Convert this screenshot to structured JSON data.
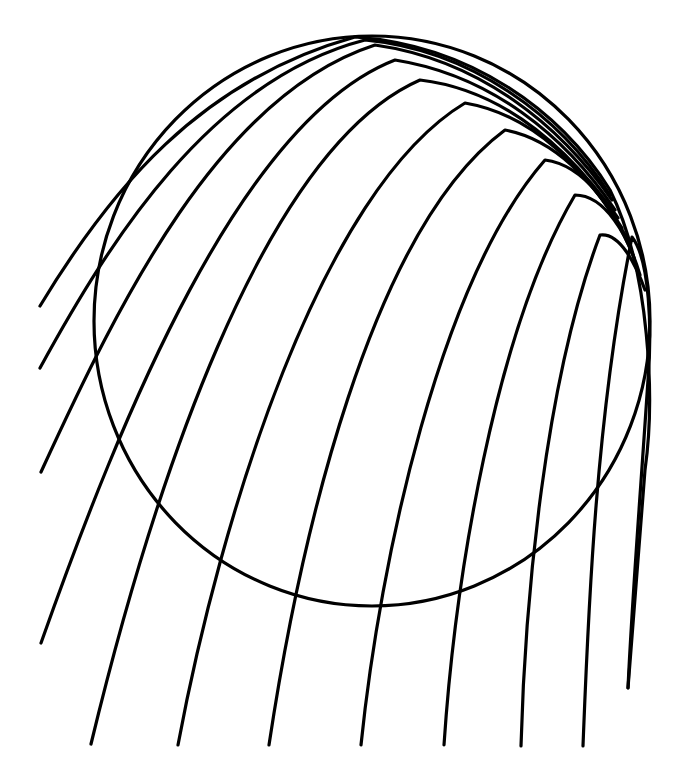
{
  "figure": {
    "width": 680,
    "height": 777,
    "background": "#ffffff",
    "ink_color": "#000000",
    "stroke_width": 3.2
  },
  "circle": {
    "cx": 372,
    "cy": 321,
    "rx": 278,
    "ry": 285
  },
  "curves": [
    {
      "id": 1,
      "d": "M40,306 C110,190 200,80 355,37 C470,45 560,110 610,190 C650,270 655,400 645,470 L628,688"
    },
    {
      "id": 2,
      "d": "M40,368 C110,240 210,80 365,40 C470,50 560,115 610,195"
    },
    {
      "id": 3,
      "d": "M41,472 C120,300 220,95 375,45 C480,60 560,125 612,200"
    },
    {
      "id": 4,
      "d": "M41,643 C120,420 240,120 395,60 C490,75 565,135 615,210"
    },
    {
      "id": 5,
      "d": "M91,744 C150,500 260,150 420,80 C505,90 570,150 618,218"
    },
    {
      "id": 6,
      "d": "M178,745 C220,520 320,190 465,103 C535,115 585,170 622,228"
    },
    {
      "id": 7,
      "d": "M269,745 C300,540 370,230 505,130 C560,140 600,190 628,240"
    },
    {
      "id": 8,
      "d": "M361,745 C380,560 440,280 545,160 C585,165 615,210 634,258"
    },
    {
      "id": 9,
      "d": "M444,745 C455,580 495,330 575,195 C605,195 628,235 640,275"
    },
    {
      "id": 10,
      "d": "M521,746 C525,600 545,380 600,235 C620,232 636,265 645,290"
    },
    {
      "id": 11,
      "d": "M583,746 C588,620 595,420 632,237 C650,260 652,330 648,380 C640,500 632,600 628,688"
    }
  ]
}
